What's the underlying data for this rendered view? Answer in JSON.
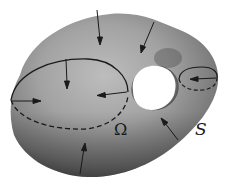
{
  "figure": {
    "type": "surface-diagram",
    "labels": {
      "region": "Ω",
      "surface": "S"
    },
    "colors": {
      "background": "#ffffff",
      "surface_light": "#b8b8b8",
      "surface_mid": "#8a8a8a",
      "surface_dark": "#4a4a4a",
      "lines": "#1a1a1a"
    },
    "curves": [
      {
        "name": "large-cross-section",
        "style": "solid front / dashed back"
      },
      {
        "name": "small-cross-section",
        "style": "solid front / dashed back"
      }
    ],
    "arrows_count": 8
  }
}
